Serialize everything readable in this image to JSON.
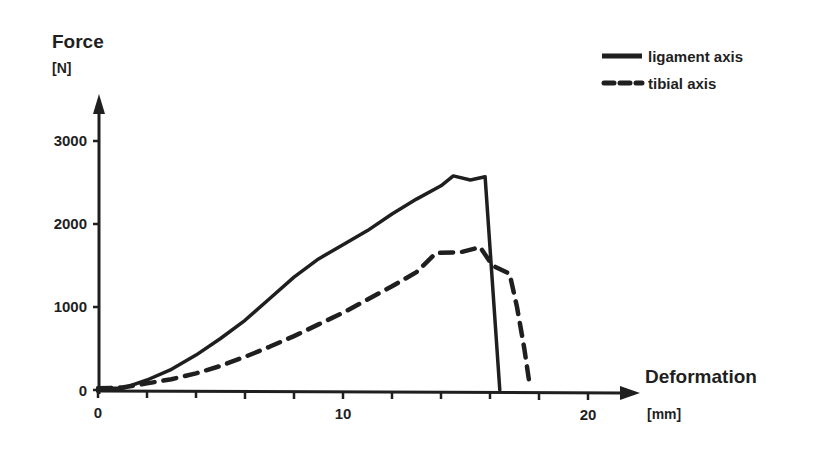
{
  "chart_data": {
    "type": "line",
    "title": "",
    "xlabel": "Deformation",
    "xunit": "[mm]",
    "ylabel": "Force",
    "yunit": "[N]",
    "xlim": [
      0,
      22
    ],
    "ylim": [
      0,
      3500
    ],
    "x_ticks": [
      0,
      10,
      20
    ],
    "x_minor_tick_step": 2,
    "y_ticks": [
      0,
      1000,
      2000,
      3000
    ],
    "grid": false,
    "legend_position": "top-right",
    "colors": {
      "line": "#1f1f1f",
      "background": "#ffffff"
    },
    "series": [
      {
        "name": "ligament axis",
        "style": "solid",
        "points": [
          [
            0,
            20
          ],
          [
            1,
            20
          ],
          [
            2,
            120
          ],
          [
            3,
            250
          ],
          [
            4,
            420
          ],
          [
            5,
            620
          ],
          [
            6,
            840
          ],
          [
            7,
            1100
          ],
          [
            8,
            1360
          ],
          [
            9,
            1580
          ],
          [
            10,
            1750
          ],
          [
            11,
            1920
          ],
          [
            12,
            2120
          ],
          [
            13,
            2300
          ],
          [
            14,
            2460
          ],
          [
            14.5,
            2580
          ],
          [
            15.2,
            2530
          ],
          [
            15.8,
            2570
          ],
          [
            16.4,
            0
          ]
        ]
      },
      {
        "name": "tibial axis",
        "style": "dashed",
        "points": [
          [
            0,
            20
          ],
          [
            1,
            30
          ],
          [
            2,
            80
          ],
          [
            3,
            130
          ],
          [
            4,
            200
          ],
          [
            5,
            290
          ],
          [
            6,
            400
          ],
          [
            7,
            520
          ],
          [
            8,
            650
          ],
          [
            9,
            790
          ],
          [
            10,
            930
          ],
          [
            11,
            1090
          ],
          [
            12,
            1250
          ],
          [
            13,
            1420
          ],
          [
            13.8,
            1650
          ],
          [
            14.8,
            1660
          ],
          [
            15.6,
            1720
          ],
          [
            16.1,
            1500
          ],
          [
            16.8,
            1400
          ],
          [
            17.1,
            1000
          ],
          [
            17.4,
            500
          ],
          [
            17.6,
            100
          ]
        ]
      }
    ]
  },
  "labels": {
    "y_title": "Force",
    "y_unit": "[N]",
    "x_title": "Deformation",
    "x_unit": "[mm]",
    "y_tick_0": "0",
    "y_tick_1000": "1000",
    "y_tick_2000": "2000",
    "y_tick_3000": "3000",
    "x_tick_0": "0",
    "x_tick_10": "10",
    "x_tick_20": "20",
    "legend_solid": "ligament axis",
    "legend_dashed": "tibial axis"
  }
}
